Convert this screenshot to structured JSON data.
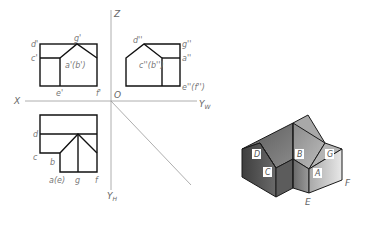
{
  "axes": {
    "z": "Z",
    "x": "X",
    "yw": "Y",
    "yw_sub": "W",
    "yh": "Y",
    "yh_sub": "H",
    "origin": "O"
  },
  "front_view": {
    "labels": {
      "d": "d'",
      "g": "g'",
      "c": "c'",
      "ab": "a'(b')",
      "e": "e'",
      "f": "f'"
    }
  },
  "side_view": {
    "labels": {
      "d": "d''",
      "g": "g''",
      "cb": "c''(b'')",
      "a": "a''",
      "ef": "e''(f'')"
    }
  },
  "top_view": {
    "labels": {
      "d": "d",
      "c": "c",
      "b": "b",
      "ae": "a(e)",
      "g": "g",
      "f": "f"
    }
  },
  "solid": {
    "face_labels": {
      "D": "D",
      "B": "B",
      "G": "G",
      "C": "C",
      "A": "A"
    },
    "vertex_labels": {
      "E": "E",
      "F": "F"
    },
    "colors": {
      "left_dark": "#4a4a4a",
      "left_mid": "#6e6e6e",
      "center": "#8a8a8a",
      "right_light": "#c8c8c8",
      "roof": "#9a9a9a"
    }
  }
}
